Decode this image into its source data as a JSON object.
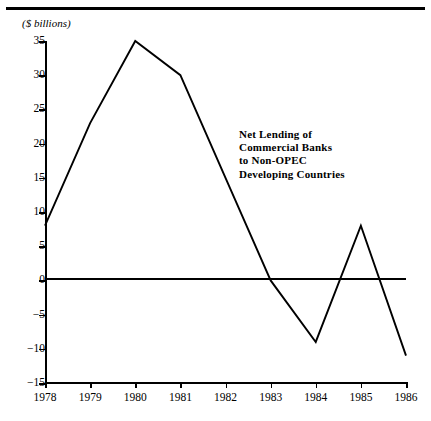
{
  "figure": {
    "unit_label": "($ billions)",
    "annotation": "Net Lending of\nCommercial Banks\nto Non-OPEC\nDeveloping Countries",
    "line_color": "#000000",
    "axis_color": "#000000",
    "background_color": "#ffffff"
  },
  "chart_data": {
    "type": "line",
    "title": "Net Lending of Commercial Banks to Non-OPEC Developing Countries",
    "xlabel": "",
    "ylabel": "($ billions)",
    "x": [
      1978,
      1979,
      1980,
      1981,
      1982,
      1983,
      1984,
      1985,
      1986
    ],
    "categories": [
      "1978",
      "1979",
      "1980",
      "1981",
      "1982",
      "1983",
      "1984",
      "1985",
      "1986"
    ],
    "values": [
      8,
      23,
      35,
      30,
      15,
      0,
      -9,
      8,
      -11
    ],
    "series": [
      {
        "name": "Net Lending of Commercial Banks to Non-OPEC Developing Countries",
        "values": [
          8,
          23,
          35,
          30,
          15,
          0,
          -9,
          8,
          -11
        ]
      }
    ],
    "xlim": [
      1978,
      1986
    ],
    "ylim": [
      -15,
      35
    ],
    "ytick_labels": [
      "35",
      "30",
      "25",
      "20",
      "15",
      "10",
      "5",
      "0",
      "-5",
      "-10",
      "-15"
    ],
    "ytick_values": [
      35,
      30,
      25,
      20,
      15,
      10,
      5,
      0,
      -5,
      -10,
      -15
    ],
    "xtick_labels": [
      "1978",
      "1979",
      "1980",
      "1981",
      "1982",
      "1983",
      "1984",
      "1985",
      "1986"
    ],
    "grid": false,
    "legend": "none",
    "zero_reference_line": true,
    "annotations": [
      {
        "text": "Net Lending of Commercial Banks to Non-OPEC Developing Countries",
        "x": 1982.2,
        "y": 20
      }
    ]
  }
}
